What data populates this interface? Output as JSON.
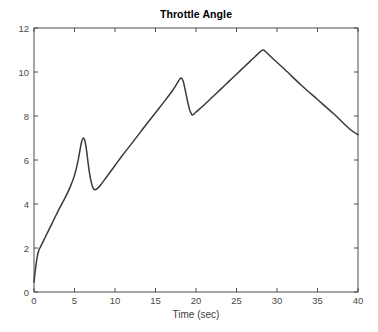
{
  "figure": {
    "background_color": "#ffffff",
    "axes_color": "#4d4d4d",
    "tick_color": "#4a4a4a"
  },
  "chart_data": {
    "type": "line",
    "title": "Throttle Angle",
    "xlabel": "Time (sec)",
    "ylabel": "",
    "xlim": [
      0,
      40
    ],
    "ylim": [
      0,
      12
    ],
    "xticks": [
      0,
      5,
      10,
      15,
      20,
      25,
      30,
      35,
      40
    ],
    "yticks": [
      0,
      2,
      4,
      6,
      8,
      10,
      12
    ],
    "grid": false,
    "legend": null,
    "line_color": "#3a3a3a",
    "line_width": 1.5,
    "series": [
      {
        "name": "Throttle Angle",
        "x": [
          0.0,
          0.2,
          0.4,
          0.6,
          0.8,
          1.0,
          1.4,
          1.8,
          2.2,
          2.6,
          3.0,
          3.5,
          4.0,
          4.5,
          5.0,
          5.4,
          5.7,
          5.9,
          6.1,
          6.3,
          6.5,
          6.7,
          6.9,
          7.1,
          7.3,
          7.5,
          7.8,
          8.2,
          9.0,
          10.0,
          11.0,
          12.0,
          13.0,
          14.0,
          15.0,
          16.0,
          17.0,
          17.6,
          18.0,
          18.2,
          18.4,
          18.6,
          18.8,
          19.0,
          19.2,
          19.4,
          19.6,
          20.0,
          21.0,
          22.0,
          23.0,
          24.0,
          25.0,
          26.0,
          27.0,
          27.8,
          28.3,
          28.8,
          29.5,
          31.0,
          33.0,
          35.0,
          37.0,
          39.0,
          40.0
        ],
        "y": [
          0.45,
          1.1,
          1.6,
          1.9,
          2.05,
          2.2,
          2.5,
          2.8,
          3.1,
          3.4,
          3.7,
          4.05,
          4.4,
          4.8,
          5.3,
          5.9,
          6.5,
          6.85,
          7.0,
          6.85,
          6.4,
          5.8,
          5.3,
          4.95,
          4.72,
          4.65,
          4.7,
          4.85,
          5.25,
          5.75,
          6.25,
          6.72,
          7.2,
          7.68,
          8.15,
          8.62,
          9.1,
          9.45,
          9.68,
          9.72,
          9.6,
          9.3,
          8.95,
          8.6,
          8.3,
          8.12,
          8.05,
          8.18,
          8.5,
          8.85,
          9.2,
          9.55,
          9.9,
          10.25,
          10.6,
          10.88,
          11.0,
          10.85,
          10.6,
          10.1,
          9.4,
          8.75,
          8.1,
          7.4,
          7.15
        ]
      }
    ]
  }
}
